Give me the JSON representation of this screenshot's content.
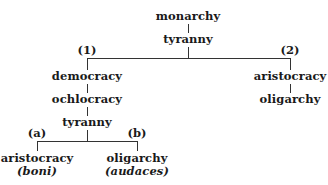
{
  "diagram": {
    "root": {
      "label": "monarchy",
      "degenerate": "tyranny"
    },
    "branches": [
      {
        "marker": "(1)",
        "sequence": [
          "democracy",
          "ochlocracy",
          "tyranny"
        ],
        "sub_branches": [
          {
            "marker": "(a)",
            "label": "aristocracy",
            "note": "(boni)"
          },
          {
            "marker": "(b)",
            "label": "oligarchy",
            "note": "(audaces)"
          }
        ]
      },
      {
        "marker": "(2)",
        "sequence": [
          "aristocracy",
          "oligarchy"
        ]
      }
    ]
  }
}
